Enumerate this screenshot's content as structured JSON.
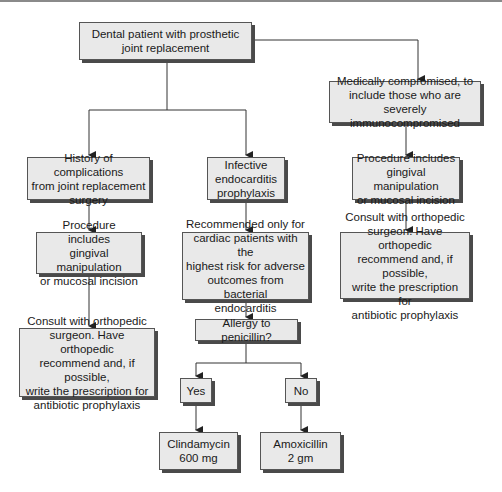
{
  "diagram": {
    "nodes": {
      "root": "Dental patient with prosthetic\njoint replacement",
      "medically_compromised": "Medically compromised, to\ninclude those who are severely\nimmunocompromised",
      "history_complications": "History of complications\nfrom joint replacement\nsurgery",
      "infective_endocarditis": "Infective\nendocarditis\nprophylaxis",
      "procedure_left": "Procedure includes\ngingival manipulation\nor mucosal incision",
      "procedure_right": "Procedure includes\ngingival manipulation\nor mucosal incision",
      "recommended_only": "Recommended only for\ncardiac patients with the\nhighest risk for adverse\noutcomes from bacterial\nendocarditis",
      "consult_left": "Consult with orthopedic\nsurgeon. Have orthopedic\nrecommend and, if possible,\nwrite the prescription for\nantibiotic prophylaxis",
      "consult_right": "Consult with orthopedic\nsurgeon. Have orthopedic\nrecommend and, if possible,\nwrite the prescription for\nantibiotic prophylaxis",
      "allergy": "Allergy to penicillin?",
      "yes": "Yes",
      "no": "No",
      "clindamycin": "Clindamycin\n600 mg",
      "amoxicillin": "Amoxicillin\n2 gm"
    },
    "edges": [
      [
        "root",
        "medically_compromised"
      ],
      [
        "root",
        "history_complications"
      ],
      [
        "root",
        "infective_endocarditis"
      ],
      [
        "history_complications",
        "procedure_left"
      ],
      [
        "procedure_left",
        "consult_left"
      ],
      [
        "infective_endocarditis",
        "recommended_only"
      ],
      [
        "recommended_only",
        "allergy"
      ],
      [
        "allergy",
        "yes"
      ],
      [
        "allergy",
        "no"
      ],
      [
        "yes",
        "clindamycin"
      ],
      [
        "no",
        "amoxicillin"
      ],
      [
        "medically_compromised",
        "procedure_right"
      ],
      [
        "procedure_right",
        "consult_right"
      ]
    ],
    "colors": {
      "box_fill": "#e9e9e9",
      "box_border": "#555555",
      "shadow": "#4a4a4a",
      "line": "#333333"
    }
  }
}
